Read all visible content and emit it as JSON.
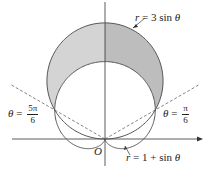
{
  "figure": {
    "origin_label": "O",
    "curves": [
      {
        "name": "circle",
        "equation": "r = 3 sin θ",
        "label_r": "r",
        "label_rest": "= 3 sin",
        "label_theta": "θ"
      },
      {
        "name": "cardioid",
        "equation": "r = 1 + sin θ",
        "label_r": "r",
        "label_rest": "= 1 + sin",
        "label_theta": "θ"
      }
    ],
    "angle_labels": [
      {
        "text": "θ = 5π/6",
        "theta": "θ",
        "eq": "=",
        "num": "5π",
        "den": "6"
      },
      {
        "text": "θ = π/6",
        "theta": "θ",
        "eq": "=",
        "num": "π",
        "den": "6"
      }
    ],
    "shaded_region": "inside r = 3 sin θ and outside r = 1 + sin θ",
    "colors": {
      "curve": "#555555",
      "shade_left": "#d4d4d4",
      "shade_right": "#bdbdbd",
      "axis": "#333333",
      "dashed": "#666666"
    },
    "geometry": {
      "ox": 105,
      "oy": 139,
      "unit": 38.7
    }
  }
}
